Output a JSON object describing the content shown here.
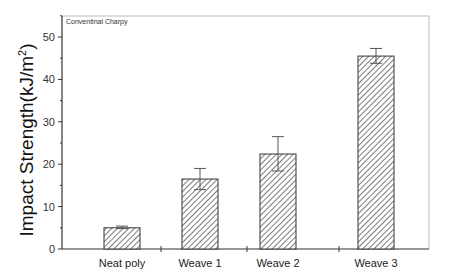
{
  "chart_data": {
    "type": "bar",
    "title": "",
    "annotation": "Conventinal Charpy",
    "xlabel": "",
    "ylabel": "Impact Strength(kJ/m²)",
    "ylabel_parts": {
      "main": "Impact Strength(kJ/m",
      "sup": "2",
      "close": ")"
    },
    "categories": [
      "Neat poly",
      "Weave 1",
      "Weave 2",
      "Weave 3"
    ],
    "values": [
      5.0,
      16.5,
      22.4,
      45.5
    ],
    "error_bars": [
      {
        "upper": 5.4,
        "lower": 4.8
      },
      {
        "upper": 19.0,
        "lower": 14.0
      },
      {
        "upper": 26.5,
        "lower": 18.4
      },
      {
        "upper": 47.3,
        "lower": 43.8
      }
    ],
    "yticks": [
      0,
      10,
      20,
      30,
      40,
      50
    ],
    "ylim": [
      0,
      55
    ],
    "grid": false,
    "legend": null,
    "bar_fill": "hatched diagonal",
    "colors": {
      "bar_edge": "#333333",
      "hatch": "#444444",
      "axis": "#333333",
      "frame": "#bbbbbb"
    }
  }
}
